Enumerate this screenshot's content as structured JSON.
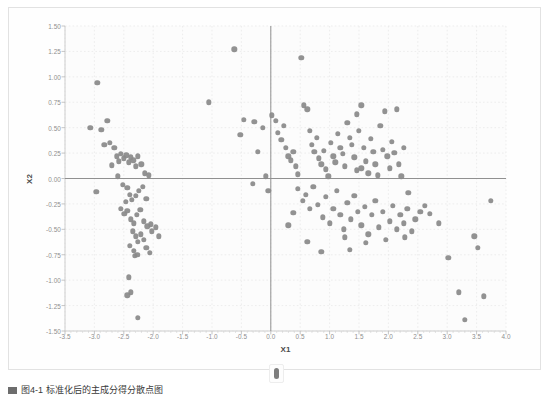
{
  "figure": {
    "caption": "图4-1  标准化后的主成分得分散点图",
    "thumb_name": "scroll-thumb"
  },
  "chart_data": {
    "type": "scatter",
    "title": "",
    "xlabel": "X1",
    "ylabel": "X2",
    "xlim": [
      -3.5,
      4.0
    ],
    "ylim": [
      -1.5,
      1.5
    ],
    "grid": true,
    "legend": "none",
    "marker_color": "#8a8a8a",
    "axis_color": "#909090",
    "grid_color": "#e6e6e6",
    "xticks": [
      -3.5,
      -3.0,
      -2.5,
      -2.0,
      -1.5,
      -1.0,
      -0.5,
      0.0,
      0.5,
      1.0,
      1.5,
      2.0,
      2.5,
      3.0,
      3.5,
      4.0
    ],
    "xtick_labels": [
      "-3.5",
      "-3.0",
      "-2.5",
      "-2.0",
      "-1.5",
      "-1.0",
      "-0.5",
      "0.0",
      "0.5",
      "1.0",
      "1.5",
      "2.0",
      "2.5",
      "3.0",
      "3.5",
      "4.0"
    ],
    "yticks": [
      -1.5,
      -1.25,
      -1.0,
      -0.75,
      -0.5,
      -0.25,
      0.0,
      0.25,
      0.5,
      0.75,
      1.0,
      1.25,
      1.5
    ],
    "ytick_labels": [
      "-1.50",
      "-1.25",
      "-1.00",
      "-0.75",
      "-0.50",
      "-0.25",
      "0.00",
      "0.25",
      "0.50",
      "0.75",
      "1.00",
      "1.25",
      "1.50"
    ],
    "reference_lines": {
      "x": 0.0,
      "y": 0.0
    },
    "points": [
      [
        -3.07,
        0.5
      ],
      [
        -2.95,
        0.94
      ],
      [
        -2.88,
        0.48
      ],
      [
        -2.97,
        -0.13
      ],
      [
        -2.83,
        0.33
      ],
      [
        -2.78,
        0.57
      ],
      [
        -2.74,
        0.35
      ],
      [
        -2.66,
        0.3
      ],
      [
        -2.62,
        0.22
      ],
      [
        -2.58,
        0.17
      ],
      [
        -2.7,
        0.13
      ],
      [
        -2.55,
        0.24
      ],
      [
        -2.5,
        0.2
      ],
      [
        -2.46,
        0.23
      ],
      [
        -2.6,
        0.02
      ],
      [
        -2.52,
        -0.06
      ],
      [
        -2.42,
        0.16
      ],
      [
        -2.38,
        0.21
      ],
      [
        -2.34,
        0.18
      ],
      [
        -2.3,
        0.12
      ],
      [
        -2.26,
        0.22
      ],
      [
        -2.2,
        0.14
      ],
      [
        -2.14,
        0.05
      ],
      [
        -2.08,
        0.03
      ],
      [
        -2.44,
        -0.09
      ],
      [
        -2.4,
        -0.16
      ],
      [
        -2.47,
        -0.23
      ],
      [
        -2.36,
        -0.21
      ],
      [
        -2.3,
        -0.17
      ],
      [
        -2.24,
        -0.12
      ],
      [
        -2.18,
        -0.08
      ],
      [
        -2.12,
        -0.2
      ],
      [
        -2.55,
        -0.3
      ],
      [
        -2.49,
        -0.35
      ],
      [
        -2.44,
        -0.32
      ],
      [
        -2.38,
        -0.4
      ],
      [
        -2.33,
        -0.44
      ],
      [
        -2.28,
        -0.36
      ],
      [
        -2.22,
        -0.31
      ],
      [
        -2.16,
        -0.42
      ],
      [
        -2.1,
        -0.47
      ],
      [
        -2.04,
        -0.45
      ],
      [
        -2.35,
        -0.52
      ],
      [
        -2.3,
        -0.57
      ],
      [
        -2.26,
        -0.62
      ],
      [
        -2.21,
        -0.55
      ],
      [
        -2.16,
        -0.6
      ],
      [
        -2.4,
        -0.66
      ],
      [
        -2.33,
        -0.71
      ],
      [
        -2.27,
        -0.75
      ],
      [
        -2.12,
        -0.68
      ],
      [
        -2.06,
        -0.73
      ],
      [
        -2.31,
        -0.76
      ],
      [
        -2.41,
        -0.97
      ],
      [
        -2.38,
        -1.12
      ],
      [
        -2.44,
        -1.15
      ],
      [
        -2.26,
        -1.37
      ],
      [
        -2.02,
        -0.52
      ],
      [
        -1.96,
        -0.48
      ],
      [
        -1.9,
        -0.57
      ],
      [
        -1.05,
        0.75
      ],
      [
        -0.62,
        1.27
      ],
      [
        -0.52,
        0.43
      ],
      [
        -0.46,
        0.58
      ],
      [
        -0.28,
        0.56
      ],
      [
        -0.22,
        0.26
      ],
      [
        -0.14,
        0.5
      ],
      [
        -0.08,
        0.02
      ],
      [
        -0.04,
        -0.12
      ],
      [
        -0.31,
        -0.05
      ],
      [
        0.02,
        0.62
      ],
      [
        0.08,
        0.57
      ],
      [
        0.12,
        0.45
      ],
      [
        0.18,
        0.38
      ],
      [
        0.22,
        0.52
      ],
      [
        0.26,
        0.3
      ],
      [
        0.3,
        0.22
      ],
      [
        0.34,
        0.18
      ],
      [
        0.38,
        0.26
      ],
      [
        0.42,
        0.12
      ],
      [
        0.46,
        0.04
      ],
      [
        0.52,
        1.19
      ],
      [
        0.56,
        0.72
      ],
      [
        0.62,
        0.68
      ],
      [
        0.66,
        0.47
      ],
      [
        0.7,
        0.33
      ],
      [
        0.74,
        0.26
      ],
      [
        0.78,
        0.4
      ],
      [
        0.82,
        0.2
      ],
      [
        0.86,
        0.14
      ],
      [
        0.9,
        0.27
      ],
      [
        0.94,
        0.09
      ],
      [
        0.98,
        0.02
      ],
      [
        1.02,
        0.35
      ],
      [
        1.06,
        0.22
      ],
      [
        1.1,
        0.16
      ],
      [
        1.14,
        0.44
      ],
      [
        1.18,
        0.3
      ],
      [
        1.22,
        0.24
      ],
      [
        1.26,
        0.12
      ],
      [
        1.3,
        0.55
      ],
      [
        1.34,
        0.4
      ],
      [
        1.38,
        0.33
      ],
      [
        1.42,
        0.21
      ],
      [
        1.46,
        0.08
      ],
      [
        1.5,
        0.47
      ],
      [
        1.54,
        0.72
      ],
      [
        1.58,
        0.3
      ],
      [
        1.62,
        0.17
      ],
      [
        1.66,
        0.05
      ],
      [
        1.7,
        0.39
      ],
      [
        1.74,
        0.26
      ],
      [
        1.78,
        0.14
      ],
      [
        1.82,
        0.03
      ],
      [
        1.86,
        0.52
      ],
      [
        1.9,
        0.28
      ],
      [
        1.94,
        0.66
      ],
      [
        1.98,
        0.22
      ],
      [
        2.02,
        0.1
      ],
      [
        2.06,
        0.36
      ],
      [
        2.1,
        0.25
      ],
      [
        2.14,
        0.68
      ],
      [
        2.18,
        0.14
      ],
      [
        2.22,
        0.02
      ],
      [
        0.46,
        -0.1
      ],
      [
        0.54,
        -0.22
      ],
      [
        0.6,
        -0.16
      ],
      [
        0.66,
        -0.3
      ],
      [
        0.72,
        -0.08
      ],
      [
        0.8,
        -0.26
      ],
      [
        0.88,
        -0.38
      ],
      [
        0.94,
        -0.18
      ],
      [
        1.0,
        -0.44
      ],
      [
        1.06,
        -0.3
      ],
      [
        1.12,
        -0.12
      ],
      [
        1.18,
        -0.36
      ],
      [
        1.24,
        -0.5
      ],
      [
        1.3,
        -0.24
      ],
      [
        1.36,
        -0.4
      ],
      [
        1.42,
        -0.17
      ],
      [
        1.48,
        -0.33
      ],
      [
        1.54,
        -0.46
      ],
      [
        1.6,
        -0.28
      ],
      [
        1.66,
        -0.55
      ],
      [
        1.72,
        -0.36
      ],
      [
        1.78,
        -0.22
      ],
      [
        1.84,
        -0.48
      ],
      [
        1.9,
        -0.33
      ],
      [
        1.96,
        -0.6
      ],
      [
        2.02,
        -0.42
      ],
      [
        2.08,
        -0.27
      ],
      [
        2.14,
        -0.5
      ],
      [
        2.2,
        -0.36
      ],
      [
        2.26,
        -0.44
      ],
      [
        2.32,
        -0.3
      ],
      [
        2.4,
        -0.52
      ],
      [
        2.46,
        -0.4
      ],
      [
        2.54,
        -0.33
      ],
      [
        0.86,
        -0.72
      ],
      [
        1.34,
        -0.7
      ],
      [
        1.62,
        -0.63
      ],
      [
        2.28,
        -0.58
      ],
      [
        2.62,
        -0.27
      ],
      [
        2.7,
        -0.35
      ],
      [
        2.86,
        -0.44
      ],
      [
        3.02,
        -0.78
      ],
      [
        3.2,
        -1.12
      ],
      [
        3.3,
        -1.39
      ],
      [
        3.46,
        -0.57
      ],
      [
        3.52,
        -0.68
      ],
      [
        3.74,
        -0.22
      ],
      [
        3.62,
        -1.16
      ],
      [
        1.26,
        -0.58
      ],
      [
        0.62,
        -0.62
      ],
      [
        0.38,
        -0.34
      ],
      [
        0.3,
        -0.46
      ],
      [
        1.46,
        0.63
      ],
      [
        1.54,
        0.1
      ],
      [
        2.26,
        0.3
      ],
      [
        2.34,
        -0.14
      ]
    ]
  }
}
